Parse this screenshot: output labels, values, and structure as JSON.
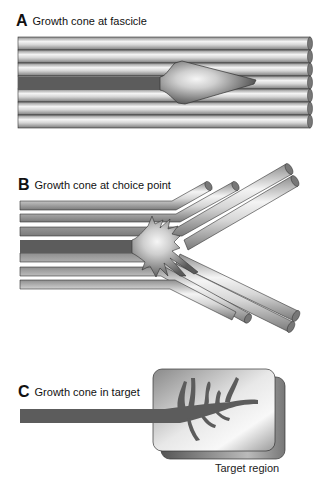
{
  "panels": [
    {
      "letter": "A",
      "caption": "Growth cone at fascicle"
    },
    {
      "letter": "B",
      "caption": "Growth cone at choice point"
    },
    {
      "letter": "C",
      "caption": "Growth cone in target"
    }
  ],
  "target_label": "Target region",
  "colors": {
    "axon": "#5a5a5a",
    "tube_light": "#f2f2f2",
    "tube_dark": "#9a9a9a",
    "outline": "#222222"
  }
}
